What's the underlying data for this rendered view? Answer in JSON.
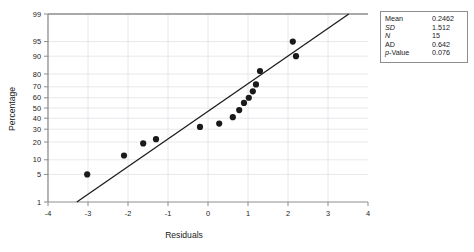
{
  "chart_data": {
    "type": "scatter",
    "title": "",
    "xlabel": "Residuals",
    "ylabel": "Percentage",
    "xlim": [
      -4,
      4
    ],
    "xticks": [
      -4,
      -3,
      -2,
      -1,
      0,
      1,
      2,
      3,
      4
    ],
    "xtick_labels": [
      "-4",
      "-3",
      "-2",
      "-1",
      "0",
      "1",
      "2",
      "3",
      "4"
    ],
    "yticks": [
      1,
      5,
      10,
      20,
      30,
      40,
      50,
      60,
      70,
      80,
      90,
      95,
      99
    ],
    "ytick_labels": [
      "1",
      "5",
      "10",
      "20",
      "30",
      "40",
      "50",
      "60",
      "70",
      "80",
      "90",
      "95",
      "99"
    ],
    "y_scale": "normal-probability",
    "grid": true,
    "legend": "none",
    "points": [
      {
        "x": -3.02,
        "y": 5.0
      },
      {
        "x": -2.1,
        "y": 12.0
      },
      {
        "x": -1.62,
        "y": 19.0
      },
      {
        "x": -1.3,
        "y": 22.0
      },
      {
        "x": -0.2,
        "y": 32.0
      },
      {
        "x": 0.28,
        "y": 35.0
      },
      {
        "x": 0.62,
        "y": 41.0
      },
      {
        "x": 0.78,
        "y": 48.0
      },
      {
        "x": 0.9,
        "y": 55.0
      },
      {
        "x": 1.02,
        "y": 60.0
      },
      {
        "x": 1.12,
        "y": 66.0
      },
      {
        "x": 1.2,
        "y": 72.0
      },
      {
        "x": 1.3,
        "y": 82.0
      },
      {
        "x": 2.12,
        "y": 95.0
      },
      {
        "x": 2.2,
        "y": 90.0
      }
    ],
    "fit_line": {
      "x_start": -3.28,
      "y_start": 1.0,
      "x_end": 3.52,
      "y_end": 99.0,
      "description": "normal reference line"
    }
  },
  "stats": {
    "rows": [
      {
        "label": "Mean",
        "value": "0.2462",
        "italic_label": false
      },
      {
        "label": "SD",
        "value": "1.512",
        "italic_label": true
      },
      {
        "label": "N",
        "value": "15",
        "italic_label": true
      },
      {
        "label": "AD",
        "value": "0.642",
        "italic_label": false
      },
      {
        "label": "p-Value",
        "value": "0.076",
        "italic_label": false
      }
    ]
  },
  "colors": {
    "point": "#1a1a1a",
    "line": "#1a1a1a",
    "grid": "#e2e2e8",
    "axis": "#8d8d8d",
    "box_border": "#8d8d8d",
    "background": "#ffffff"
  }
}
